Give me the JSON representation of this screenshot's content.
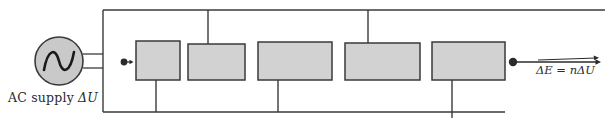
{
  "diagram": {
    "type": "circuit-schematic",
    "width": 608,
    "height": 123,
    "colors": {
      "background": "#ffffff",
      "wire": "#3a3a3a",
      "electrode_fill": "#d2d2d2",
      "electrode_stroke": "#3a3a3a",
      "source_fill": "#c9c9c9",
      "source_stroke": "#3a3a3a",
      "particle": "#2b2b2b",
      "text": "#2b2b2b"
    },
    "source": {
      "name": "AC supply",
      "symbol": "sine-wave",
      "label": "AC supply  ΔU",
      "label_prefix": "AC supply",
      "label_quantity": "ΔU",
      "center_x": 59,
      "center_y": 61,
      "radius": 24
    },
    "output": {
      "label": "ΔE = nΔU",
      "label_lhs": "ΔE",
      "label_relation": "=",
      "label_rhs": "nΔU",
      "vector_arrow": true,
      "arrow_direction": "right",
      "particle_dot_x": 513,
      "arrow_end_x": 601
    },
    "input": {
      "particle_dot_x": 124,
      "particle_dot_y": 62,
      "arrow_direction": "right",
      "arrow_end_x": 133
    },
    "electrodes": [
      {
        "index": 1,
        "x": 136,
        "y": 41,
        "width": 44,
        "height": 39,
        "stem": "down",
        "stem_x": 156
      },
      {
        "index": 2,
        "x": 188,
        "y": 44,
        "width": 57,
        "height": 36,
        "stem": "up",
        "stem_x": 208
      },
      {
        "index": 3,
        "x": 258,
        "y": 42,
        "width": 74,
        "height": 38,
        "stem": "down",
        "stem_x": 278
      },
      {
        "index": 4,
        "x": 345,
        "y": 43,
        "width": 75,
        "height": 37,
        "stem": "up",
        "stem_x": 368
      },
      {
        "index": 5,
        "x": 432,
        "y": 42,
        "width": 73,
        "height": 38,
        "stem": "down",
        "stem_x": 452
      }
    ],
    "rails": {
      "top_y": 10,
      "bottom_y": 112,
      "left_x": 103,
      "right_x": 505
    },
    "leads": {
      "upper_y": 54,
      "lower_y": 68,
      "from_x": 83,
      "to_x": 103
    }
  }
}
